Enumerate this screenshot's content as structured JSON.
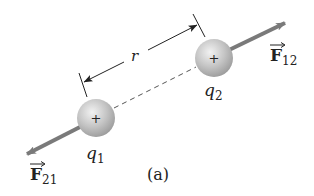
{
  "diagram": {
    "caption": "(a)",
    "distance_label": "r",
    "charges": [
      {
        "id": "q1",
        "label_base": "q",
        "label_sub": "1",
        "sign": "+",
        "cx": 96,
        "cy": 118,
        "r": 19
      },
      {
        "id": "q2",
        "label_base": "q",
        "label_sub": "2",
        "sign": "+",
        "cx": 214,
        "cy": 58,
        "r": 19
      }
    ],
    "forces": [
      {
        "id": "F21",
        "label_base": "F",
        "label_sub": "21",
        "on": "q1",
        "direction": "away-from-q2"
      },
      {
        "id": "F12",
        "label_base": "F",
        "label_sub": "12",
        "on": "q2",
        "direction": "away-from-q1"
      }
    ],
    "colors": {
      "sphere_fill": "#c8c8c8",
      "sphere_highlight": "#eeeeee",
      "sphere_shadow": "#9a9a9a",
      "force_arrow": "#7a7a7a",
      "dimension_line": "#222222",
      "dashed_line": "#555555",
      "text": "#222222"
    }
  }
}
